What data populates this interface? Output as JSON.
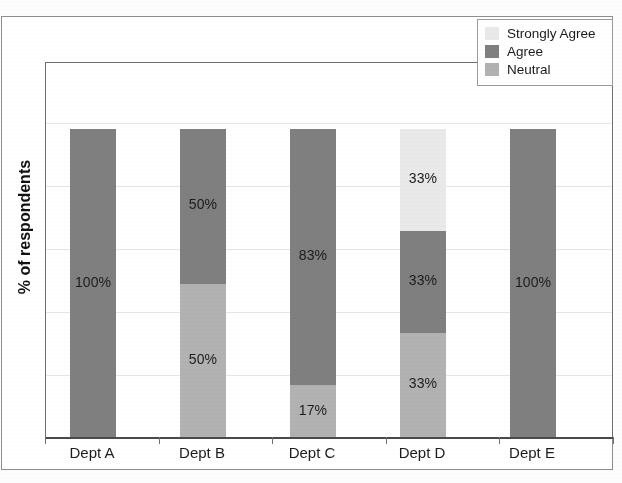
{
  "chart_data": {
    "type": "bar",
    "subtype": "stacked-bar-100-percent",
    "title": "",
    "xlabel": "",
    "ylabel": "% of respondents",
    "ylim": [
      0,
      100
    ],
    "grid": true,
    "legend_position": "top-right",
    "categories": [
      "Dept A",
      "Dept B",
      "Dept C",
      "Dept D",
      "Dept E"
    ],
    "series": [
      {
        "name": "Strongly Agree",
        "color": "#e9e9e9",
        "values": [
          0,
          0,
          0,
          33,
          0
        ],
        "labels": [
          "",
          "",
          "",
          "33%",
          ""
        ]
      },
      {
        "name": "Agree",
        "color": "#7f7f7f",
        "values": [
          100,
          50,
          83,
          33,
          100
        ],
        "labels": [
          "100%",
          "50%",
          "83%",
          "33%",
          "100%"
        ]
      },
      {
        "name": "Neutral",
        "color": "#b2b2b2",
        "values": [
          0,
          50,
          17,
          33,
          0
        ],
        "labels": [
          "",
          "50%",
          "17%",
          "33%",
          ""
        ]
      }
    ],
    "stack_order_top_to_bottom": [
      "Strongly Agree",
      "Agree",
      "Neutral"
    ]
  },
  "legend": {
    "items": [
      {
        "label": "Strongly Agree",
        "color": "#e9e9e9"
      },
      {
        "label": "Agree",
        "color": "#7f7f7f"
      },
      {
        "label": "Neutral",
        "color": "#b2b2b2"
      }
    ]
  },
  "axes": {
    "y_title": "% of respondents",
    "x_tick_labels": [
      "Dept A",
      "Dept B",
      "Dept C",
      "Dept D",
      "Dept E"
    ]
  },
  "bars": [
    {
      "category": "Dept A",
      "segments": [
        {
          "series": "Agree",
          "value": 100,
          "label": "100%",
          "color": "#7f7f7f"
        }
      ]
    },
    {
      "category": "Dept B",
      "segments": [
        {
          "series": "Agree",
          "value": 50,
          "label": "50%",
          "color": "#7f7f7f"
        },
        {
          "series": "Neutral",
          "value": 50,
          "label": "50%",
          "color": "#b2b2b2"
        }
      ]
    },
    {
      "category": "Dept C",
      "segments": [
        {
          "series": "Agree",
          "value": 83,
          "label": "83%",
          "color": "#7f7f7f"
        },
        {
          "series": "Neutral",
          "value": 17,
          "label": "17%",
          "color": "#b2b2b2"
        }
      ]
    },
    {
      "category": "Dept D",
      "segments": [
        {
          "series": "Strongly Agree",
          "value": 33,
          "label": "33%",
          "color": "#e9e9e9"
        },
        {
          "series": "Agree",
          "value": 33,
          "label": "33%",
          "color": "#7f7f7f"
        },
        {
          "series": "Neutral",
          "value": 34,
          "label": "33%",
          "color": "#b2b2b2"
        }
      ]
    },
    {
      "category": "Dept E",
      "segments": [
        {
          "series": "Agree",
          "value": 100,
          "label": "100%",
          "color": "#7f7f7f"
        }
      ]
    }
  ],
  "layout": {
    "bar_centers_x": [
      92,
      202,
      312,
      422,
      532
    ],
    "bar_width": 46,
    "plot_left": 45,
    "plot_top": 62,
    "plot_right": 613,
    "plot_bottom": 437,
    "bar_top": 128,
    "gridlines_y": [
      122,
      185,
      248,
      311,
      374
    ]
  }
}
